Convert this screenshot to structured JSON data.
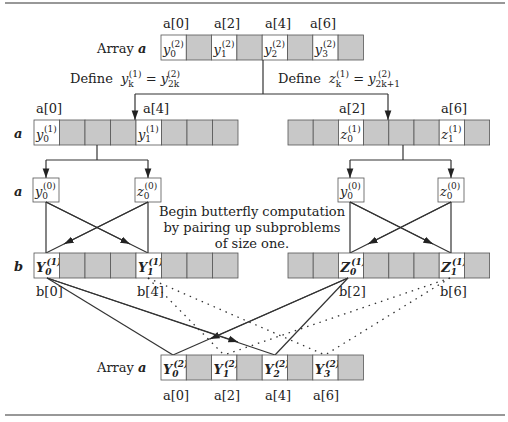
{
  "caption": {
    "line1": "Begin butterfly computation",
    "line2": "by pairing up subproblems",
    "line3": "of size one."
  },
  "labels": {
    "array_a_top": "Array",
    "array_a_bottom": "Array",
    "array_var": "a",
    "row_a1": "a",
    "row_a2": "a",
    "row_b": "b",
    "define_y": "Define",
    "define_z": "Define"
  },
  "top_array": {
    "index_labels": [
      "a[0]",
      "a[2]",
      "a[4]",
      "a[6]"
    ],
    "cells": [
      {
        "base": "y",
        "sub": "0",
        "sup": "(2)",
        "shade": "white"
      },
      {
        "shade": "gray"
      },
      {
        "base": "y",
        "sub": "1",
        "sup": "(2)",
        "shade": "white"
      },
      {
        "shade": "gray"
      },
      {
        "base": "y",
        "sub": "2",
        "sup": "(2)",
        "shade": "white"
      },
      {
        "shade": "gray"
      },
      {
        "base": "y",
        "sub": "3",
        "sup": "(2)",
        "shade": "white"
      },
      {
        "shade": "gray"
      }
    ]
  },
  "definitions": {
    "y_def": {
      "lhs": "y",
      "lhs_sub": "k",
      "lhs_sup": "(1)",
      "rhs": "y",
      "rhs_sub": "2k",
      "rhs_sup": "(2)"
    },
    "z_def": {
      "lhs": "z",
      "lhs_sub": "k",
      "lhs_sup": "(1)",
      "rhs": "y",
      "rhs_sub": "2k+1",
      "rhs_sup": "(2)"
    }
  },
  "left_mid_array": {
    "index_labels": [
      "a[0]",
      "a[4]"
    ],
    "cells": [
      {
        "base": "y",
        "sub": "0",
        "sup": "(1)",
        "shade": "white"
      },
      {
        "shade": "gray"
      },
      {
        "shade": "gray"
      },
      {
        "shade": "gray"
      },
      {
        "base": "y",
        "sub": "1",
        "sup": "(1)",
        "shade": "white"
      },
      {
        "shade": "gray"
      },
      {
        "shade": "gray"
      },
      {
        "shade": "gray"
      }
    ]
  },
  "right_mid_array": {
    "index_labels": [
      "a[2]",
      "a[6]"
    ],
    "cells": [
      {
        "shade": "gray"
      },
      {
        "shade": "gray"
      },
      {
        "base": "z",
        "sub": "0",
        "sup": "(1)",
        "shade": "white"
      },
      {
        "shade": "gray"
      },
      {
        "shade": "gray"
      },
      {
        "shade": "gray"
      },
      {
        "base": "z",
        "sub": "1",
        "sup": "(1)",
        "shade": "white"
      },
      {
        "shade": "gray"
      }
    ]
  },
  "leaf_boxes": [
    {
      "base": "y",
      "sub": "0",
      "sup": "(0)"
    },
    {
      "base": "z",
      "sub": "0",
      "sup": "(0)"
    },
    {
      "base": "y",
      "sub": "0",
      "sup": "(0)"
    },
    {
      "base": "z",
      "sub": "0",
      "sup": "(0)"
    }
  ],
  "left_b_array": {
    "index_labels": [
      "b[0]",
      "b[4]"
    ],
    "cells": [
      {
        "base": "Y",
        "sub": "0",
        "sup": "(1)",
        "shade": "white"
      },
      {
        "shade": "gray"
      },
      {
        "shade": "gray"
      },
      {
        "shade": "gray"
      },
      {
        "base": "Y",
        "sub": "1",
        "sup": "(1)",
        "shade": "white"
      },
      {
        "shade": "gray"
      },
      {
        "shade": "gray"
      },
      {
        "shade": "gray"
      }
    ]
  },
  "right_b_array": {
    "index_labels": [
      "b[2]",
      "b[6]"
    ],
    "cells": [
      {
        "shade": "gray"
      },
      {
        "shade": "gray"
      },
      {
        "base": "Z",
        "sub": "0",
        "sup": "(1)",
        "shade": "white"
      },
      {
        "shade": "gray"
      },
      {
        "shade": "gray"
      },
      {
        "shade": "gray"
      },
      {
        "base": "Z",
        "sub": "1",
        "sup": "(1)",
        "shade": "white"
      },
      {
        "shade": "gray"
      }
    ]
  },
  "bottom_array": {
    "index_labels": [
      "a[0]",
      "a[2]",
      "a[4]",
      "a[6]"
    ],
    "cells": [
      {
        "base": "Y",
        "sub": "0",
        "sup": "(2)",
        "shade": "white"
      },
      {
        "shade": "gray"
      },
      {
        "base": "Y",
        "sub": "1",
        "sup": "(2)",
        "shade": "white"
      },
      {
        "shade": "gray"
      },
      {
        "base": "Y",
        "sub": "2",
        "sup": "(2)",
        "shade": "white"
      },
      {
        "shade": "gray"
      },
      {
        "base": "Y",
        "sub": "3",
        "sup": "(2)",
        "shade": "white"
      },
      {
        "shade": "gray"
      }
    ]
  }
}
